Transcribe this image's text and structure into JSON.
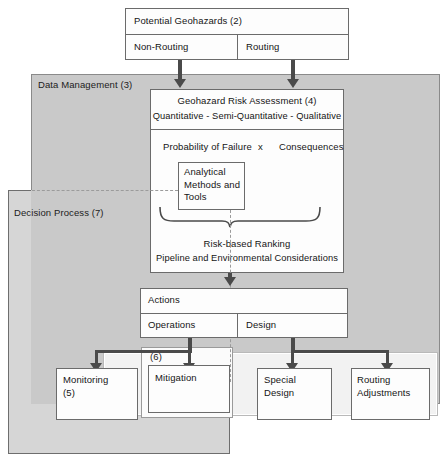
{
  "diagram": {
    "panels": {
      "data_management": "Data Management (3)",
      "decision_process": "Decision Process (7)",
      "mitigation_group": "(6)"
    },
    "top": {
      "header": "Potential Geohazards (2)",
      "left_cell": "Non-Routing",
      "right_cell": "Routing"
    },
    "assessment": {
      "title": "Geohazard Risk Assessment (4)",
      "subtitle": "Quantitative - Semi-Quantitative - Qualitative",
      "equation_left": "Probability of Failure",
      "equation_operator": "x",
      "equation_right": "Consequences",
      "tools_box": "Analytical\nMethods and\nTools",
      "ranking_line1": "Risk-based Ranking",
      "ranking_line2": "Pipeline and Environmental Considerations"
    },
    "actions": {
      "header": "Actions",
      "left_cell": "Operations",
      "right_cell": "Design"
    },
    "outcomes": [
      {
        "label": "Monitoring\n(5)"
      },
      {
        "label": "Mitigation"
      },
      {
        "label": "Special\nDesign"
      },
      {
        "label": "Routing\nAdjustments"
      }
    ],
    "colors": {
      "data_management_fill": "#c9c9c9",
      "decision_process_fill": "#d6d6d6",
      "box_fill": "#fdfdfd",
      "line": "#4a4a4a",
      "border": "#6b6b6b"
    }
  }
}
